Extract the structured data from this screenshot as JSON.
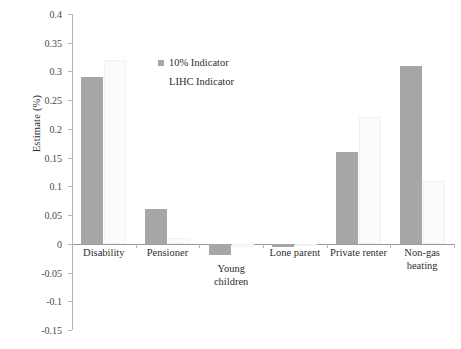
{
  "chart_data": {
    "type": "bar",
    "title": "",
    "xlabel": "",
    "ylabel": "Estimate (%)",
    "ylim": [
      -0.15,
      0.4
    ],
    "ytick_step": 0.05,
    "grid": false,
    "legend_position": "inside-upper-center",
    "categories": [
      "Disability",
      "Pensioner",
      "Young\nchildren",
      "Lone parent",
      "Private renter",
      "Non-gas\nheating"
    ],
    "yticks": [
      "0.4",
      "0.35",
      "0.3",
      "0.25",
      "0.2",
      "0.15",
      "0.1",
      "0.05",
      "0",
      "-0.05",
      "-0.1",
      "-0.15"
    ],
    "ytick_values": [
      0.4,
      0.35,
      0.3,
      0.25,
      0.2,
      0.15,
      0.1,
      0.05,
      0,
      -0.05,
      -0.1,
      -0.15
    ],
    "series": [
      {
        "name": "10% Indicator",
        "color": "#a6a6a6",
        "values": [
          0.29,
          0.06,
          -0.02,
          -0.005,
          0.16,
          0.31
        ]
      },
      {
        "name": "LIHC Indicator",
        "color": "#fbfbfb",
        "values": [
          0.32,
          0.01,
          -0.005,
          -0.002,
          0.22,
          0.11
        ]
      }
    ]
  },
  "legend": {
    "entries": [
      {
        "label": "10% Indicator",
        "swatch": "legend-swatch-primary"
      },
      {
        "label": "LIHC Indicator",
        "swatch": "legend-swatch-secondary"
      }
    ]
  },
  "axes": {
    "y_title": "Estimate (%)"
  }
}
